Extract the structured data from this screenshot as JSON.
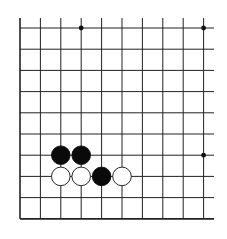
{
  "board": {
    "type": "go-diagram",
    "description": "Partial Go board (lower-left corner view, open on top and right)",
    "columns": 10,
    "rows": 10,
    "grid_origin_x": 20,
    "grid_origin_y": 28,
    "col_spacing": 20.4,
    "row_spacing": 21.2,
    "line_color": "#222222",
    "background": "#ffffff",
    "star_points": [
      {
        "col": 3,
        "row": 0
      },
      {
        "col": 9,
        "row": 0
      },
      {
        "col": 9,
        "row": 6
      }
    ],
    "stones": [
      {
        "color": "black",
        "col": 2,
        "row": 6
      },
      {
        "color": "black",
        "col": 3,
        "row": 6
      },
      {
        "color": "white",
        "col": 2,
        "row": 7
      },
      {
        "color": "white",
        "col": 3,
        "row": 7
      },
      {
        "color": "black",
        "col": 4,
        "row": 7
      },
      {
        "color": "white",
        "col": 5,
        "row": 7
      }
    ]
  }
}
